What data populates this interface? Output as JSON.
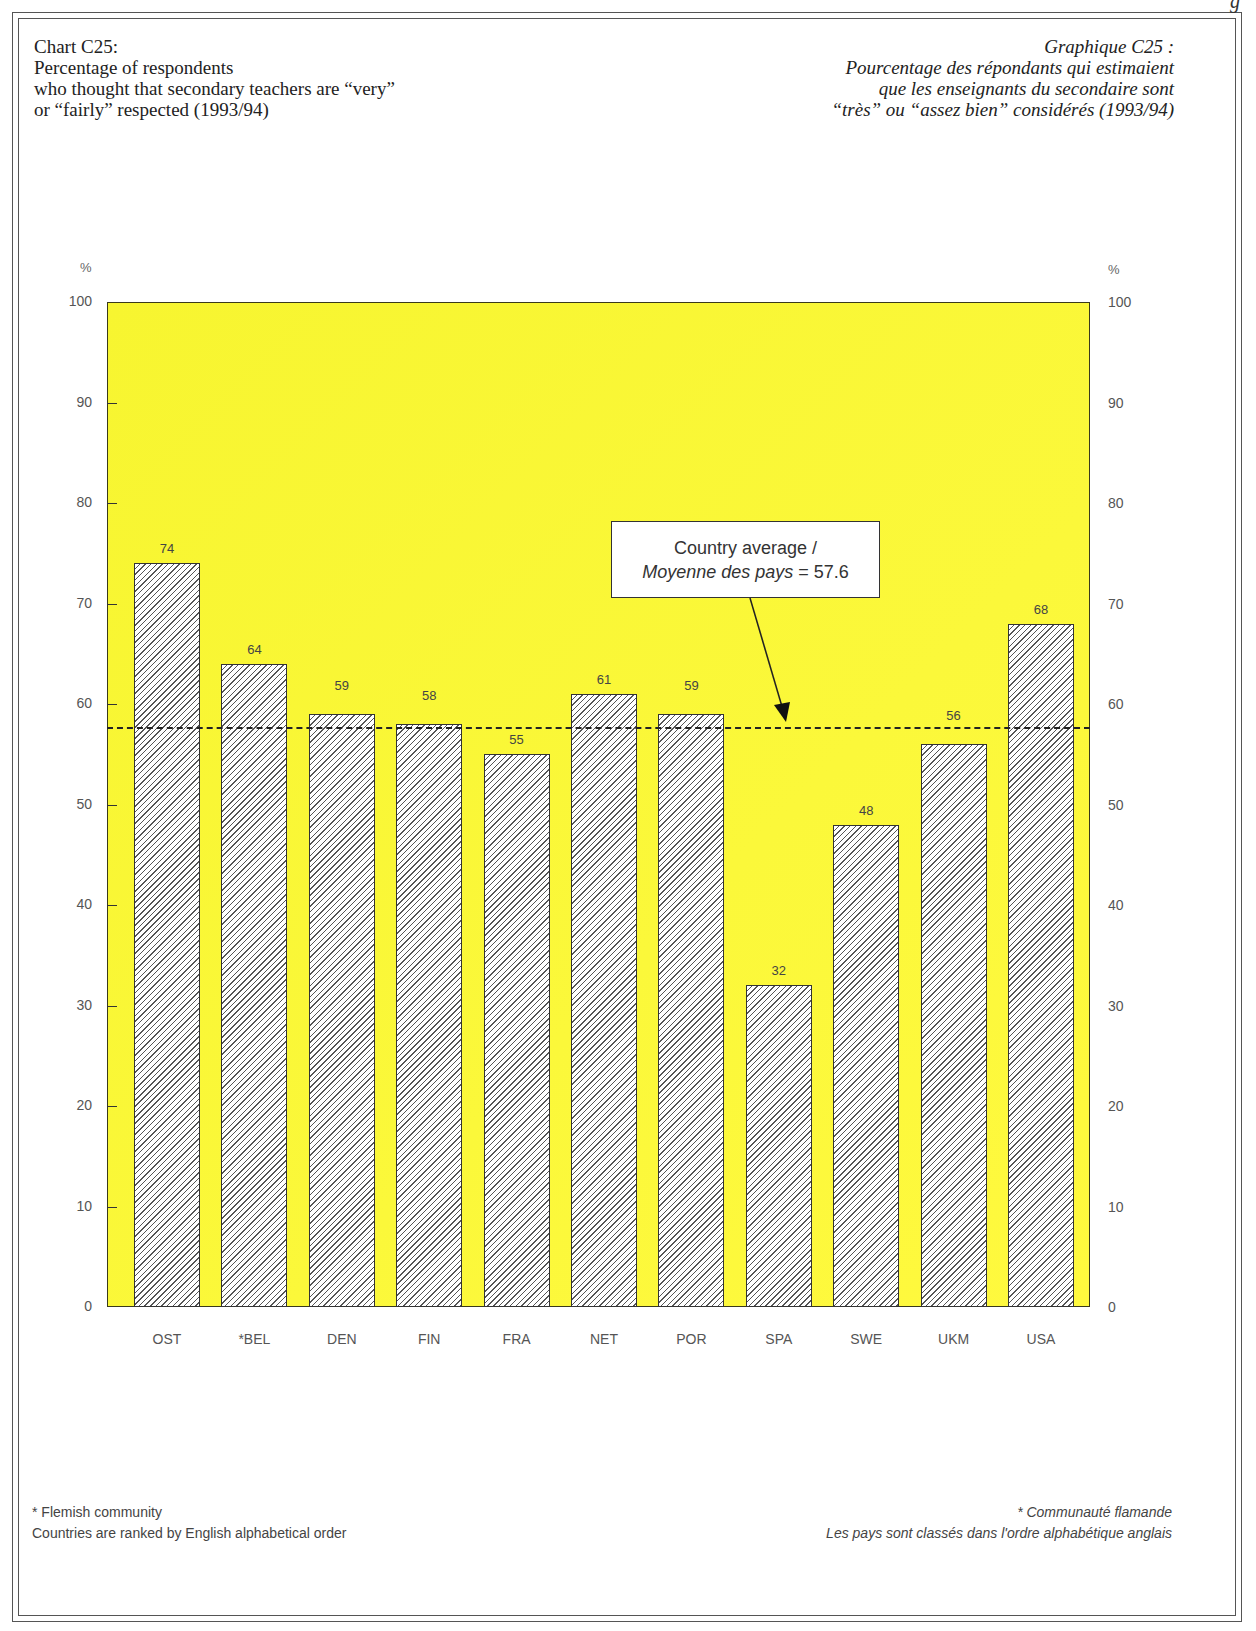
{
  "page": {
    "corner_fragment": "g",
    "title_en": {
      "line1": "Chart C25:",
      "line2": "Percentage of respondents",
      "line3": "who thought that secondary teachers are “very”",
      "line4": "or “fairly” respected (1993/94)"
    },
    "title_fr": {
      "line1": "Graphique C25 :",
      "line2": "Pourcentage des répondants qui estimaient",
      "line3": "que les enseignants du secondaire sont",
      "line4": "“très” ou “assez bien” considérés (1993/94)"
    },
    "callout": {
      "line1": "Country average /",
      "line2_italic": "Moyenne des pays",
      "line2_value": " = 57.6"
    },
    "footer_en": {
      "note": "* Flemish community",
      "ranking": "Countries are ranked by English alphabetical order"
    },
    "footer_fr": {
      "note": "* Communauté flamande",
      "ranking": "Les pays sont classés dans l'ordre alphabétique anglais"
    },
    "axis_unit": "%",
    "colors": {
      "plot_background": "#f9f734",
      "bar_fill": "#ffffff",
      "bar_hatch": "#555555",
      "average_line": "#222222"
    }
  },
  "chart_data": {
    "type": "bar",
    "title": "Chart C25: Percentage of respondents who thought that secondary teachers are “very” or “fairly” respected (1993/94)",
    "title_fr": "Graphique C25 : Pourcentage des répondants qui estimaient que les enseignants du secondaire sont “très” ou “assez bien” considérés (1993/94)",
    "xlabel": "",
    "ylabel": "%",
    "ylim": [
      0,
      100
    ],
    "yticks": [
      0,
      10,
      20,
      30,
      40,
      50,
      60,
      70,
      80,
      90,
      100
    ],
    "ytick_labels": [
      "0",
      "10",
      "20",
      "30",
      "40",
      "50",
      "60",
      "70",
      "80",
      "90",
      "100"
    ],
    "y_axis_both_sides": true,
    "grid": false,
    "categories": [
      "OST",
      "*BEL",
      "DEN",
      "FIN",
      "FRA",
      "NET",
      "POR",
      "SPA",
      "SWE",
      "UKM",
      "USA"
    ],
    "values": [
      74,
      64,
      59,
      58,
      55,
      61,
      59,
      32,
      48,
      56,
      68
    ],
    "value_labels": [
      "74",
      "64",
      "59",
      "58",
      "55",
      "61",
      "59",
      "32",
      "48",
      "56",
      "68"
    ],
    "reference_line": {
      "value": 57.6,
      "style": "dashed",
      "label": "Country average / Moyenne des pays = 57.6"
    },
    "bar_pattern": "diagonal hatch",
    "annotations": [
      "* Flemish community",
      "Countries are ranked by English alphabetical order",
      "* Communauté flamande",
      "Les pays sont classés dans l'ordre alphabétique anglais"
    ]
  }
}
